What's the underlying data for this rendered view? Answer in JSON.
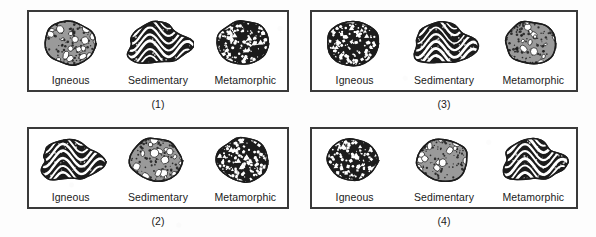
{
  "figure": {
    "type": "multiple-choice-diagram",
    "rock_textures": {
      "conglomerate": "gray matrix with rounded white pebbles and dark stipple",
      "banded": "dark folded rock with wavy white bands",
      "speckled": "dark rock with many small white angular crystal specks"
    }
  },
  "panels": [
    {
      "number": "(1)",
      "rocks": [
        {
          "label": "Igneous",
          "texture": "conglomerate"
        },
        {
          "label": "Sedimentary",
          "texture": "banded"
        },
        {
          "label": "Metamorphic",
          "texture": "speckled"
        }
      ]
    },
    {
      "number": "(3)",
      "rocks": [
        {
          "label": "Igneous",
          "texture": "speckled"
        },
        {
          "label": "Sedimentary",
          "texture": "banded"
        },
        {
          "label": "Metamorphic",
          "texture": "conglomerate"
        }
      ]
    },
    {
      "number": "(2)",
      "rocks": [
        {
          "label": "Igneous",
          "texture": "banded"
        },
        {
          "label": "Sedimentary",
          "texture": "conglomerate"
        },
        {
          "label": "Metamorphic",
          "texture": "speckled"
        }
      ]
    },
    {
      "number": "(4)",
      "rocks": [
        {
          "label": "Igneous",
          "texture": "speckled"
        },
        {
          "label": "Sedimentary",
          "texture": "conglomerate"
        },
        {
          "label": "Metamorphic",
          "texture": "banded"
        }
      ]
    }
  ],
  "colors": {
    "frame": "#3a3a3a",
    "background": "#fdfdfd",
    "text": "#1a1a1a",
    "rock_dark": "#1c1c1c",
    "rock_gray": "#9a9a9a",
    "rock_light": "#ffffff"
  }
}
